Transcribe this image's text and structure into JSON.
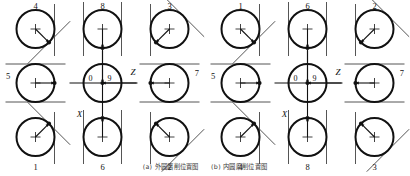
{
  "figure": {
    "caption_a": "(a) 外圆磨削位置图",
    "caption_b": "(b) 内圆磨削位置图",
    "stroke_color": "#111111",
    "thin_color": "#555555",
    "background": "#ffffff"
  },
  "axes": {
    "x_label": "X",
    "z_label": "Z",
    "origin_left_label": "0",
    "origin_right_label": "9"
  },
  "groups": [
    {
      "name": "group-a",
      "cells": [
        {
          "id": "a-r1c1",
          "label": "4",
          "label_pos": "top",
          "kind": "diag",
          "diag": "nw-se",
          "dot": "se",
          "arrow_to": "se",
          "vline": "right"
        },
        {
          "id": "a-r1c2",
          "label": "8",
          "label_pos": "top",
          "kind": "vert",
          "diag": "none",
          "dot": "s",
          "arrow_to": "s",
          "vline": "both"
        },
        {
          "id": "a-r1c3",
          "label": "3",
          "label_pos": "top",
          "kind": "diag",
          "diag": "sw-ne",
          "dot": "sw",
          "arrow_to": "sw",
          "vline": "left"
        },
        {
          "id": "a-r2c1",
          "label": "5",
          "label_pos": "left",
          "kind": "horiz",
          "diag": "none",
          "dot": "e",
          "arrow_to": "e",
          "hline": "both"
        },
        {
          "id": "a-r2c2",
          "label": "",
          "label_pos": "none",
          "kind": "axes",
          "diag": "none",
          "dot": "c",
          "arrow_to": "c",
          "hline": "none"
        },
        {
          "id": "a-r2c3",
          "label": "7",
          "label_pos": "right",
          "kind": "horiz",
          "diag": "none",
          "dot": "w",
          "arrow_to": "w",
          "hline": "both"
        },
        {
          "id": "a-r3c1",
          "label": "1",
          "label_pos": "bottom",
          "kind": "diag",
          "diag": "sw-ne",
          "dot": "ne",
          "arrow_to": "ne",
          "vline": "right"
        },
        {
          "id": "a-r3c2",
          "label": "6",
          "label_pos": "bottom",
          "kind": "vert",
          "diag": "none",
          "dot": "n",
          "arrow_to": "n",
          "vline": "both"
        },
        {
          "id": "a-r3c3",
          "label": "2",
          "label_pos": "bottom",
          "kind": "diag",
          "diag": "nw-se",
          "dot": "nw",
          "arrow_to": "nw",
          "vline": "left"
        }
      ]
    },
    {
      "name": "group-b",
      "cells": [
        {
          "id": "b-r1c1",
          "label": "1",
          "label_pos": "top",
          "kind": "diag",
          "diag": "nw-se",
          "dot": "se",
          "arrow_to": "se",
          "vline": "right"
        },
        {
          "id": "b-r1c2",
          "label": "6",
          "label_pos": "top",
          "kind": "vert",
          "diag": "none",
          "dot": "s",
          "arrow_to": "s",
          "vline": "both"
        },
        {
          "id": "b-r1c3",
          "label": "2",
          "label_pos": "top",
          "kind": "diag",
          "diag": "sw-ne",
          "dot": "sw",
          "arrow_to": "sw",
          "vline": "left"
        },
        {
          "id": "b-r2c1",
          "label": "5",
          "label_pos": "left",
          "kind": "horiz",
          "diag": "none",
          "dot": "e",
          "arrow_to": "e",
          "hline": "both"
        },
        {
          "id": "b-r2c2",
          "label": "",
          "label_pos": "none",
          "kind": "axes",
          "diag": "none",
          "dot": "c",
          "arrow_to": "c",
          "hline": "none"
        },
        {
          "id": "b-r2c3",
          "label": "7",
          "label_pos": "right",
          "kind": "horiz",
          "diag": "none",
          "dot": "w",
          "arrow_to": "w",
          "hline": "both"
        },
        {
          "id": "b-r3c1",
          "label": "4",
          "label_pos": "bottom",
          "kind": "diag",
          "diag": "sw-ne",
          "dot": "ne",
          "arrow_to": "ne",
          "vline": "right"
        },
        {
          "id": "b-r3c2",
          "label": "8",
          "label_pos": "bottom",
          "kind": "vert",
          "diag": "none",
          "dot": "n",
          "arrow_to": "n",
          "vline": "both"
        },
        {
          "id": "b-r3c3",
          "label": "3",
          "label_pos": "bottom",
          "kind": "diag",
          "diag": "nw-se",
          "dot": "nw",
          "arrow_to": "nw",
          "vline": "left"
        }
      ]
    }
  ]
}
